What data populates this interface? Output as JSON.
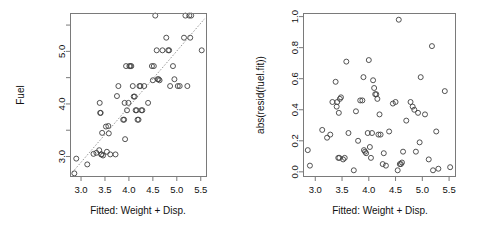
{
  "figure": {
    "background": "#ffffff",
    "point_color": "#404040",
    "axis_color": "#7a7a7a",
    "text_color": "#111111",
    "layout": "1 row x 2 columns"
  },
  "chart_data": [
    {
      "type": "scatter",
      "panel": "left",
      "title": "",
      "xlabel": "Fitted: Weight + Disp.",
      "ylabel": "Fuel",
      "xlim": [
        2.78,
        5.62
      ],
      "ylim": [
        2.62,
        5.72
      ],
      "xticks": [
        3.0,
        3.5,
        4.0,
        4.5,
        5.0,
        5.5
      ],
      "xtick_labels": [
        "3.0",
        "3.5",
        "4.0",
        "4.5",
        "5.0",
        "5.5"
      ],
      "yticks": [
        3.0,
        4.0,
        5.0
      ],
      "ytick_labels": [
        "3.0",
        "4.0",
        "5.0"
      ],
      "yticks_minor": [
        3.5,
        4.5,
        5.5
      ],
      "grid": false,
      "legend": "none",
      "marker": "open-circle",
      "annotations": [
        {
          "kind": "reference-line",
          "style": "dotted",
          "description": "identity line y = x",
          "x0": 2.82,
          "y0": 2.7,
          "x1": 5.58,
          "y1": 5.62
        }
      ],
      "x": [
        2.86,
        2.9,
        3.13,
        3.26,
        3.32,
        3.38,
        3.39,
        3.4,
        3.41,
        3.42,
        3.43,
        3.44,
        3.46,
        3.52,
        3.54,
        3.57,
        3.58,
        3.61,
        3.72,
        3.75,
        3.78,
        3.88,
        3.9,
        3.91,
        3.92,
        3.94,
        3.96,
        3.99,
        4.01,
        4.03,
        4.05,
        4.08,
        4.1,
        4.12,
        4.14,
        4.16,
        4.18,
        4.2,
        4.22,
        4.24,
        4.26,
        4.28,
        4.32,
        4.4,
        4.48,
        4.5,
        4.52,
        4.55,
        4.58,
        4.6,
        4.62,
        4.64,
        4.7,
        4.78,
        4.82,
        4.84,
        4.86,
        4.92,
        4.95,
        5.02,
        5.06,
        5.15,
        5.18,
        5.22,
        5.26,
        5.28,
        5.3,
        5.52
      ],
      "y": [
        2.68,
        2.96,
        2.85,
        3.05,
        3.07,
        3.12,
        4.02,
        3.83,
        3.83,
        3.04,
        3.04,
        3.45,
        3.02,
        3.57,
        3.09,
        3.58,
        3.44,
        3.04,
        3.04,
        4.15,
        4.34,
        3.7,
        3.7,
        4.02,
        3.33,
        4.72,
        3.88,
        4.02,
        4.72,
        4.72,
        4.72,
        4.34,
        4.14,
        4.14,
        3.88,
        3.88,
        3.7,
        3.7,
        4.34,
        4.34,
        3.88,
        3.88,
        4.34,
        4.02,
        4.72,
        4.45,
        4.72,
        5.68,
        5.02,
        4.47,
        4.47,
        4.45,
        5.02,
        5.26,
        5.02,
        5.02,
        4.34,
        4.72,
        4.47,
        4.34,
        4.34,
        5.26,
        5.68,
        4.34,
        5.68,
        5.26,
        5.68,
        5.02
      ]
    },
    {
      "type": "scatter",
      "panel": "right",
      "title": "",
      "xlabel": "Fitted: Weight + Disp.",
      "ylabel": "abs(resid(fuel.fit))",
      "xlim": [
        2.78,
        5.62
      ],
      "ylim": [
        -0.03,
        1.02
      ],
      "xticks": [
        3.0,
        3.5,
        4.0,
        4.5,
        5.0,
        5.5
      ],
      "xtick_labels": [
        "3.0",
        "3.5",
        "4.0",
        "4.5",
        "5.0",
        "5.5"
      ],
      "yticks": [
        0.0,
        0.2,
        0.4,
        0.6,
        0.8,
        1.0
      ],
      "ytick_labels": [
        "0.0",
        "0.2",
        "0.4",
        "0.6",
        "0.8",
        "1.0"
      ],
      "grid": false,
      "legend": "none",
      "marker": "open-circle",
      "annotations": [],
      "x": [
        2.86,
        2.9,
        3.13,
        3.22,
        3.28,
        3.32,
        3.38,
        3.4,
        3.41,
        3.43,
        3.44,
        3.45,
        3.46,
        3.48,
        3.52,
        3.55,
        3.58,
        3.62,
        3.72,
        3.76,
        3.8,
        3.84,
        3.88,
        3.9,
        3.91,
        3.93,
        3.95,
        3.98,
        4.0,
        4.02,
        4.04,
        4.06,
        4.08,
        4.1,
        4.12,
        4.14,
        4.16,
        4.18,
        4.2,
        4.22,
        4.26,
        4.28,
        4.32,
        4.38,
        4.45,
        4.5,
        4.54,
        4.56,
        4.58,
        4.6,
        4.62,
        4.64,
        4.7,
        4.78,
        4.82,
        4.85,
        4.88,
        4.92,
        4.95,
        4.97,
        5.05,
        5.12,
        5.18,
        5.2,
        5.26,
        5.3,
        5.42,
        5.52
      ],
      "y": [
        0.14,
        0.04,
        0.27,
        0.22,
        0.24,
        0.45,
        0.58,
        0.42,
        0.45,
        0.09,
        0.38,
        0.09,
        0.47,
        0.48,
        0.08,
        0.09,
        0.71,
        0.25,
        0.01,
        0.39,
        0.2,
        0.46,
        0.46,
        0.61,
        0.14,
        0.13,
        0.12,
        0.25,
        0.72,
        0.16,
        0.09,
        0.25,
        0.59,
        0.54,
        0.5,
        0.5,
        0.47,
        0.24,
        0.37,
        0.24,
        0.05,
        0.12,
        0.04,
        0.26,
        0.44,
        0.45,
        0.01,
        0.98,
        0.05,
        0.05,
        0.06,
        0.13,
        0.33,
        0.45,
        0.42,
        0.4,
        0.13,
        0.38,
        0.19,
        0.61,
        0.37,
        0.08,
        0.81,
        0.01,
        0.26,
        0.02,
        0.52,
        0.03
      ]
    }
  ],
  "panels": {
    "left": {
      "ylabel": "Fuel",
      "xlabel": "Fitted: Weight + Disp.",
      "xtick_labels": [
        "3.0",
        "3.5",
        "4.0",
        "4.5",
        "5.0",
        "5.5"
      ],
      "ytick_labels": [
        "3.0",
        "4.0",
        "5.0"
      ]
    },
    "right": {
      "ylabel": "abs(resid(fuel.fit))",
      "xlabel": "Fitted: Weight + Disp.",
      "xtick_labels": [
        "3.0",
        "3.5",
        "4.0",
        "4.5",
        "5.0",
        "5.5"
      ],
      "ytick_labels": [
        "0.0",
        "0.2",
        "0.4",
        "0.6",
        "0.8",
        "1.0"
      ]
    }
  }
}
